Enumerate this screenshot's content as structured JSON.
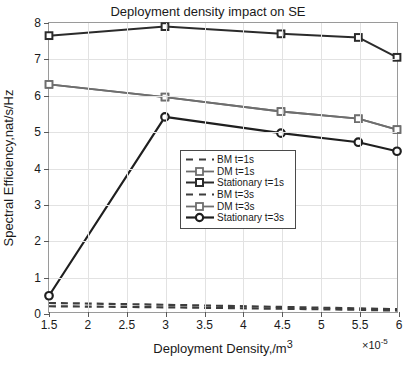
{
  "chart_data": {
    "type": "line",
    "title": "Deployment density impact on SE",
    "xlabel": "Deployment Density,/m",
    "xlabel_sup": "3",
    "ylabel": "Spectral Efficiency,nat/s/Hz",
    "x_multiplier": "×10",
    "x_multiplier_exp": "-5",
    "xlim": [
      1.5,
      6
    ],
    "ylim": [
      0,
      8
    ],
    "xticks": [
      1.5,
      2,
      2.5,
      3,
      3.5,
      4,
      4.5,
      5,
      5.5,
      6
    ],
    "xticklabels": [
      "1.5",
      "2",
      "2.5",
      "3",
      "3.5",
      "4",
      "4.5",
      "5",
      "5.5",
      "6"
    ],
    "yticks": [
      0,
      1,
      2,
      3,
      4,
      5,
      6,
      7,
      8
    ],
    "yticklabels": [
      "0",
      "1",
      "2",
      "3",
      "4",
      "5",
      "6",
      "7",
      "8"
    ],
    "grid": true,
    "legend_position": "center",
    "x": [
      1.5,
      3,
      4.5,
      5.5,
      6
    ],
    "series": [
      {
        "name": "BM t=1s",
        "values": [
          0.25,
          0.2,
          0.14,
          0.1,
          0.08
        ],
        "color": "#3d3d3d",
        "style": "dashed",
        "marker": "none",
        "width": 2.2
      },
      {
        "name": "DM t=1s",
        "values": [
          6.3,
          5.95,
          5.55,
          5.35,
          5.05
        ],
        "color": "#6e6e6e",
        "style": "solid",
        "marker": "square",
        "width": 1.8
      },
      {
        "name": "Stationary t=1s",
        "values": [
          7.65,
          7.9,
          7.7,
          7.6,
          7.05
        ],
        "color": "#2b2b2b",
        "style": "solid",
        "marker": "square",
        "width": 2.0
      },
      {
        "name": "BM t=3s",
        "values": [
          0.16,
          0.13,
          0.09,
          0.06,
          0.04
        ],
        "color": "#3d3d3d",
        "style": "dashed",
        "marker": "none",
        "width": 2.2
      },
      {
        "name": "DM t=3s",
        "values": [
          6.3,
          5.95,
          5.55,
          5.35,
          5.05
        ],
        "color": "#6e6e6e",
        "style": "solid",
        "marker": "square",
        "width": 1.8
      },
      {
        "name": "Stationary t=3s",
        "values": [
          0.45,
          5.4,
          4.95,
          4.7,
          4.45
        ],
        "color": "#1f1f1f",
        "style": "solid",
        "marker": "circle",
        "width": 2.2
      }
    ]
  }
}
